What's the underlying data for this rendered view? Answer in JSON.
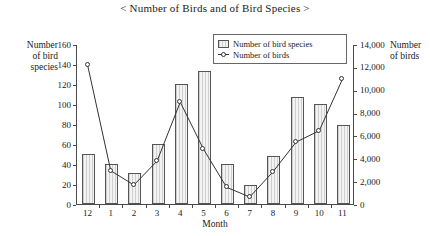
{
  "chart_data": {
    "type": "bar",
    "title": "< Number of Birds and of Bird Species >",
    "xlabel": "Month",
    "ylabel": "Number of bird species",
    "y2label": "Number of birds",
    "categories": [
      "12",
      "1",
      "2",
      "3",
      "4",
      "5",
      "6",
      "7",
      "8",
      "9",
      "10",
      "11"
    ],
    "ylim": [
      0,
      160
    ],
    "y2lim": [
      0,
      14000
    ],
    "yticks": [
      "0",
      "20",
      "40",
      "60",
      "80",
      "100",
      "120",
      "140",
      "160"
    ],
    "y2ticks": [
      "0",
      "2,000",
      "4,000",
      "6,000",
      "8,000",
      "10,000",
      "12,000",
      "14,000"
    ],
    "grid": false,
    "legend_position": "top-right",
    "series": [
      {
        "name": "Number of bird species",
        "type": "bar",
        "axis": "left",
        "values": [
          50,
          40,
          31,
          60,
          120,
          133,
          40,
          19,
          48,
          107,
          100,
          79
        ]
      },
      {
        "name": "Number of birds",
        "type": "line",
        "axis": "right",
        "values": [
          12250,
          3000,
          1750,
          3850,
          9000,
          4900,
          1550,
          700,
          2900,
          5500,
          6500,
          11000
        ]
      }
    ]
  },
  "legend": {
    "entries": [
      {
        "label": "Number of bird species"
      },
      {
        "label": "Number of birds"
      }
    ]
  },
  "axes": {
    "left_title_line1": "Number",
    "left_title_line2": "of bird",
    "left_title_line3": "species",
    "right_title_line1": "Number",
    "right_title_line2": "of birds"
  }
}
